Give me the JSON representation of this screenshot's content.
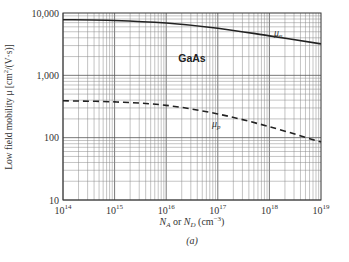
{
  "chart_data": {
    "type": "line",
    "title": "",
    "xlabel": "N_A or N_D (cm^-3)",
    "xlabel_parts": {
      "a": "N",
      "a_sub": "A",
      "mid": " or ",
      "b": "N",
      "b_sub": "D",
      "unit": " (cm",
      "unit_sup": "−3",
      "close": ")"
    },
    "ylabel": "Low field mobility μ [cm²/(V·s)]",
    "ylabel_parts": {
      "pre": "Low field mobility μ [cm",
      "sup": "2",
      "post": "/(V·s)]"
    },
    "xscale": "log",
    "yscale": "log",
    "xlim": [
      100000000000000.0,
      1e+19
    ],
    "ylim": [
      10,
      10000
    ],
    "x_ticks": [
      {
        "base": "10",
        "exp": "14"
      },
      {
        "base": "10",
        "exp": "15"
      },
      {
        "base": "10",
        "exp": "16"
      },
      {
        "base": "10",
        "exp": "17"
      },
      {
        "base": "10",
        "exp": "18"
      },
      {
        "base": "10",
        "exp": "19"
      }
    ],
    "y_ticks": [
      "10,000",
      "1,000",
      "100",
      "10"
    ],
    "grid": true,
    "annotation": "GaAs",
    "caption": "(a)",
    "series": [
      {
        "name": "μn",
        "label_main": "μ",
        "label_sub": "n",
        "style": "solid",
        "x": [
          100000000000000.0,
          1000000000000000.0,
          1e+16,
          1e+17,
          1e+18,
          1e+19
        ],
        "values": [
          7800,
          7600,
          6900,
          5700,
          4300,
          3200
        ]
      },
      {
        "name": "μp",
        "label_main": "μ",
        "label_sub": "p",
        "style": "dashed",
        "x": [
          100000000000000.0,
          1000000000000000.0,
          1e+16,
          1e+17,
          1e+18,
          1e+19
        ],
        "values": [
          390,
          375,
          330,
          240,
          150,
          85
        ]
      }
    ]
  }
}
